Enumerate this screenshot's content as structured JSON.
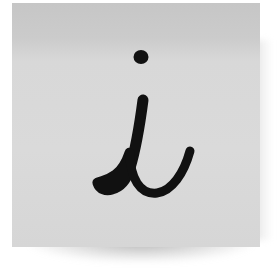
{
  "scene": {
    "subject": "sticky-note",
    "note_color": "#d8d8d8",
    "note_top_color": "#c6c6c6",
    "ink_color": "#111111",
    "handwritten_glyph": "i",
    "icon": "info-icon"
  }
}
